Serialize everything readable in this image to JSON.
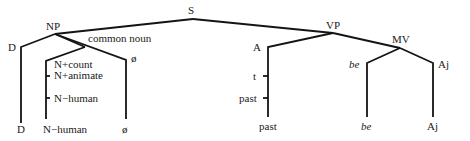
{
  "diagram": {
    "type": "syntax-tree",
    "nodes": {
      "S": "S",
      "NP": "NP",
      "VP": "VP",
      "D_top": "D",
      "common_noun": "common noun",
      "N_count": "N+count",
      "N_animate": "N+animate",
      "N_human": "N−human",
      "null_top": "ø",
      "A": "A",
      "t": "t",
      "past_mid": "past",
      "MV": "MV",
      "be_top": "be",
      "Aj_top": "Aj"
    },
    "leaves": {
      "D": "D",
      "N_human": "N−human",
      "null": "ø",
      "past": "past",
      "be": "be",
      "Aj": "Aj"
    }
  }
}
